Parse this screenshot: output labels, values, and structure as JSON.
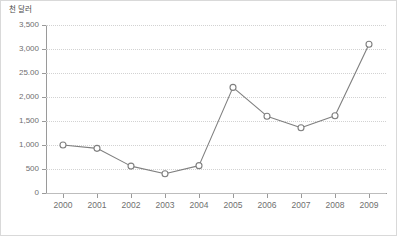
{
  "chart_data": {
    "type": "line",
    "title": "",
    "subtitle": "",
    "unit_label": "천 달러",
    "xlabel": "",
    "ylabel": "",
    "categories": [
      "2000",
      "2001",
      "2002",
      "2003",
      "2004",
      "2005",
      "2006",
      "2007",
      "2008",
      "2009"
    ],
    "values": [
      1000,
      930,
      560,
      400,
      570,
      2200,
      1600,
      1360,
      1610,
      3100
    ],
    "series": [
      {
        "name": "",
        "values": [
          1000,
          930,
          560,
          400,
          570,
          2200,
          1600,
          1360,
          1610,
          3100
        ]
      }
    ],
    "ylim": [
      0,
      3500
    ],
    "ytick_values": [
      0,
      500,
      1000,
      1500,
      2000,
      2500,
      3000,
      3500
    ],
    "ytick_labels": [
      "0",
      "500",
      "1,000",
      "1,500",
      "2,000",
      "25.00",
      "3,000",
      "3,500"
    ],
    "grid": true,
    "grid_axis": "y",
    "legend": false,
    "legend_position": "none",
    "marker": "open-circle",
    "line_color": "#7f7f7f",
    "marker_fill": "#ffffff",
    "marker_stroke": "#7f7f7f",
    "grid_color": "#d2d2d2",
    "axis_color": "#9a9a9a",
    "text_color": "#6f6f6f",
    "border_color": "#d9d9d9",
    "background": "#ffffff"
  },
  "caption": {
    "text": ""
  }
}
